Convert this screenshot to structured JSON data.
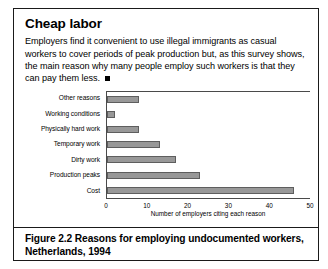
{
  "source_credit": "Tanchelet, C. and Gravesteinjn-Ligtheim, J. 1994.",
  "box": {
    "title": "Cheap labor",
    "body": "Employers find it convenient to use illegal immigrants as casual workers to cover periods of peak production but, as this survey shows, the main reason why many people employ such workers is that they can pay them less."
  },
  "caption": "Figure 2.2 Reasons for employing undocumented workers, Netherlands, 1994",
  "colors": {
    "bar_fill": "#989898",
    "bar_stroke": "#5e5e5e",
    "axis": "#4a4a4a",
    "frame": "#1a1a1a"
  },
  "chart_data": {
    "type": "bar",
    "orientation": "horizontal",
    "title": "",
    "xlabel": "Number of employers citing each reason",
    "ylabel": "",
    "xlim": [
      0,
      50
    ],
    "xticks": [
      0,
      10,
      20,
      30,
      40,
      50
    ],
    "grid": false,
    "legend": false,
    "categories": [
      "Other reasons",
      "Working conditions",
      "Physically hard work",
      "Temporary work",
      "Dirty work",
      "Production peaks",
      "Cost"
    ],
    "values": [
      8,
      2,
      8,
      13,
      17,
      23,
      46
    ]
  }
}
